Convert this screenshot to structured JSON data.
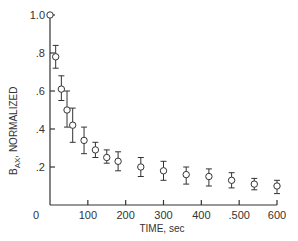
{
  "chart_data": {
    "type": "scatter",
    "title": "",
    "xlabel": "TIME, sec",
    "ylabel": "B_AX, NORMALIZED",
    "ylabel_main": "B",
    "ylabel_sub": "AX",
    "ylabel_rest": ", NORMALIZED",
    "xlim": [
      0,
      600
    ],
    "ylim": [
      0,
      1.0
    ],
    "grid": false,
    "legend": null,
    "x_ticks": [
      0,
      100,
      200,
      300,
      400,
      500,
      600
    ],
    "x_tick_labels": [
      "0",
      "100",
      "200",
      "300",
      "400",
      ".500",
      "600"
    ],
    "y_ticks": [
      0.2,
      0.4,
      0.6,
      0.8,
      1.0
    ],
    "y_tick_labels": [
      ".2",
      ".4",
      ".6",
      ".8",
      "1.0"
    ],
    "series": [
      {
        "name": "B_AX normalized",
        "marker": "open-circle",
        "points": [
          {
            "x": 0,
            "y": 1.0,
            "err_low": 1.0,
            "err_high": 1.0
          },
          {
            "x": 15,
            "y": 0.78,
            "err_low": 0.72,
            "err_high": 0.84
          },
          {
            "x": 30,
            "y": 0.61,
            "err_low": 0.55,
            "err_high": 0.68
          },
          {
            "x": 45,
            "y": 0.5,
            "err_low": 0.41,
            "err_high": 0.6
          },
          {
            "x": 60,
            "y": 0.42,
            "err_low": 0.33,
            "err_high": 0.51
          },
          {
            "x": 90,
            "y": 0.34,
            "err_low": 0.27,
            "err_high": 0.41
          },
          {
            "x": 120,
            "y": 0.29,
            "err_low": 0.25,
            "err_high": 0.33
          },
          {
            "x": 150,
            "y": 0.25,
            "err_low": 0.22,
            "err_high": 0.29
          },
          {
            "x": 180,
            "y": 0.23,
            "err_low": 0.18,
            "err_high": 0.28
          },
          {
            "x": 240,
            "y": 0.2,
            "err_low": 0.15,
            "err_high": 0.25
          },
          {
            "x": 300,
            "y": 0.18,
            "err_low": 0.13,
            "err_high": 0.23
          },
          {
            "x": 360,
            "y": 0.16,
            "err_low": 0.11,
            "err_high": 0.2
          },
          {
            "x": 420,
            "y": 0.15,
            "err_low": 0.1,
            "err_high": 0.19
          },
          {
            "x": 480,
            "y": 0.13,
            "err_low": 0.09,
            "err_high": 0.17
          },
          {
            "x": 540,
            "y": 0.11,
            "err_low": 0.08,
            "err_high": 0.14
          },
          {
            "x": 600,
            "y": 0.1,
            "err_low": 0.06,
            "err_high": 0.13
          }
        ]
      }
    ]
  },
  "style": {
    "ink_color": "#333333",
    "background": "#ffffff"
  }
}
